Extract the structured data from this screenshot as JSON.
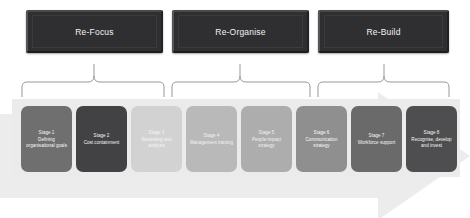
{
  "diagram": {
    "arrow_color": "#ececec",
    "band_color": "#ebebeb",
    "header_color": "#2f2f31"
  },
  "phases": [
    {
      "label": "Re-Focus"
    },
    {
      "label": "Re-Organise"
    },
    {
      "label": "Re-Build"
    }
  ],
  "stages": [
    {
      "number": "Stage 1",
      "title": "Defining organisational goals",
      "color": "#6f6f6f"
    },
    {
      "number": "Stage 2",
      "title": "Cost containment",
      "color": "#424244"
    },
    {
      "number": "Stage 3",
      "title": "Reviewing and analysis",
      "color": "#d2d2d2"
    },
    {
      "number": "Stage 4",
      "title": "Management training",
      "color": "#b9b9b9"
    },
    {
      "number": "Stage 5",
      "title": "People impact strategy",
      "color": "#adadad"
    },
    {
      "number": "Stage 6",
      "title": "Communication strategy",
      "color": "#8f8f8f"
    },
    {
      "number": "Stage 7",
      "title": "Workforce support",
      "color": "#6a6a6a"
    },
    {
      "number": "Stage 8",
      "title": "Recognise, develop and invest",
      "color": "#4e4e50"
    }
  ]
}
